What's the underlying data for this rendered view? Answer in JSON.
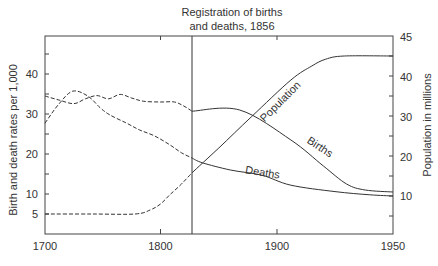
{
  "chart_data": {
    "type": "line",
    "title": "",
    "annotation": {
      "text_line1": "Registration of births",
      "text_line2": "and deaths, 1856",
      "x": 1827
    },
    "xlabel": "",
    "ylabel_left": "Birth and death rates per 1,000",
    "ylabel_right": "Population in millions",
    "x_ticks": [
      1700,
      1800,
      1900,
      1950
    ],
    "y_left_ticks": [
      5,
      10,
      20,
      30,
      40
    ],
    "y_right_ticks": [
      10,
      20,
      30,
      40,
      45
    ],
    "xlim": [
      1700,
      1950
    ],
    "ylim_left": [
      0,
      50
    ],
    "ylim_right": [
      0,
      45
    ],
    "grid": false,
    "legend": "inline labels",
    "series": [
      {
        "name": "Births",
        "axis": "left",
        "style_before_annotation": "dashed",
        "style_after_annotation": "solid",
        "points": [
          [
            1700,
            34.5
          ],
          [
            1712,
            33.5
          ],
          [
            1725,
            32.6
          ],
          [
            1735,
            33.8
          ],
          [
            1745,
            34.6
          ],
          [
            1755,
            33.8
          ],
          [
            1765,
            34.9
          ],
          [
            1775,
            34
          ],
          [
            1785,
            33.2
          ],
          [
            1800,
            33
          ],
          [
            1812,
            33
          ],
          [
            1820,
            32
          ],
          [
            1827,
            30.7
          ],
          [
            1868,
            31
          ],
          [
            1906,
            23.5
          ],
          [
            1920,
            17
          ],
          [
            1930,
            12.5
          ],
          [
            1938,
            11
          ],
          [
            1950,
            10.5
          ]
        ],
        "label": "Births"
      },
      {
        "name": "Deaths",
        "axis": "left",
        "style_before_annotation": "dashed",
        "style_after_annotation": "solid",
        "points": [
          [
            1700,
            27.7
          ],
          [
            1712,
            32.5
          ],
          [
            1724,
            35.7
          ],
          [
            1737,
            34.5
          ],
          [
            1748,
            31.5
          ],
          [
            1756,
            29.8
          ],
          [
            1770,
            27.8
          ],
          [
            1782,
            26
          ],
          [
            1795,
            24.5
          ],
          [
            1808,
            22.3
          ],
          [
            1818,
            20.3
          ],
          [
            1827,
            19
          ],
          [
            1836,
            17.8
          ],
          [
            1860,
            16
          ],
          [
            1887,
            14.7
          ],
          [
            1906,
            12.2
          ],
          [
            1925,
            10.6
          ],
          [
            1940,
            9.8
          ],
          [
            1950,
            9.5
          ]
        ],
        "label": "Deaths"
      },
      {
        "name": "Population",
        "axis": "right",
        "style_before_annotation": "dashed",
        "style_after_annotation": "solid",
        "points": [
          [
            1700,
            5.5
          ],
          [
            1740,
            5.5
          ],
          [
            1778,
            5.5
          ],
          [
            1791,
            6.5
          ],
          [
            1800,
            8
          ],
          [
            1808,
            10.3
          ],
          [
            1818,
            13
          ],
          [
            1827,
            15.8
          ],
          [
            1850,
            22
          ],
          [
            1878,
            29.8
          ],
          [
            1906,
            39
          ],
          [
            1915,
            42.5
          ],
          [
            1921,
            44.2
          ],
          [
            1929,
            45
          ],
          [
            1950,
            45
          ]
        ],
        "label": "Population"
      }
    ]
  },
  "labels": {
    "annotation_line1": "Registration of births",
    "annotation_line2": "and deaths, 1856",
    "ylabel_left": "Birth and death rates per 1,000",
    "ylabel_right": "Population in millions",
    "series_births": "Births",
    "series_deaths": "Deaths",
    "series_population": "Population",
    "x_ticks": [
      "1700",
      "1800",
      "1900",
      "1950"
    ],
    "y_left_ticks": [
      "40",
      "30",
      "20",
      "10",
      "5"
    ],
    "y_right_ticks": [
      "45",
      "40",
      "30",
      "20",
      "10"
    ]
  },
  "colors": {
    "line": "#333333",
    "axis": "#444444",
    "text": "#333333",
    "background": "#ffffff"
  }
}
